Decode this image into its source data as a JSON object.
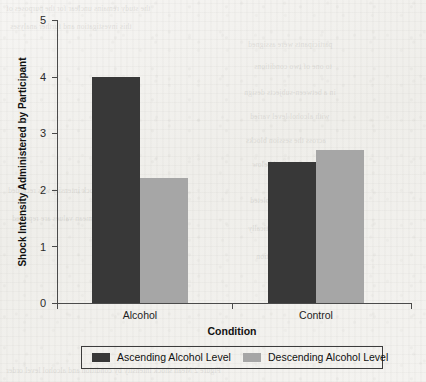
{
  "chart_data": {
    "type": "bar",
    "title": "",
    "xlabel": "Condition",
    "ylabel": "Shock Intensity Administered by Participant",
    "categories": [
      "Alcohol",
      "Control"
    ],
    "series": [
      {
        "name": "Ascending Alcohol Level",
        "color": "#383838",
        "values": [
          4.0,
          2.5
        ]
      },
      {
        "name": "Descending Alcohol Level",
        "color": "#a6a6a6",
        "values": [
          2.2,
          2.7
        ]
      }
    ],
    "ylim": [
      0,
      5
    ],
    "yticks": [
      "0",
      "1",
      "2",
      "3",
      "4",
      "5"
    ],
    "grid": false,
    "legend_position": "bottom"
  },
  "axes": {
    "y_title": "Shock Intensity Administered by Participant",
    "x_title": "Condition",
    "y_tick_0": "0",
    "y_tick_1": "1",
    "y_tick_2": "2",
    "y_tick_3": "3",
    "y_tick_4": "4",
    "y_tick_5": "5",
    "cat_1": "Alcohol",
    "cat_2": "Control"
  },
  "legend": {
    "entry_1_label": "Ascending Alcohol Level",
    "entry_2_label": "Descending Alcohol Level",
    "entry_1_color": "#383838",
    "entry_2_color": "#a6a6a6"
  }
}
